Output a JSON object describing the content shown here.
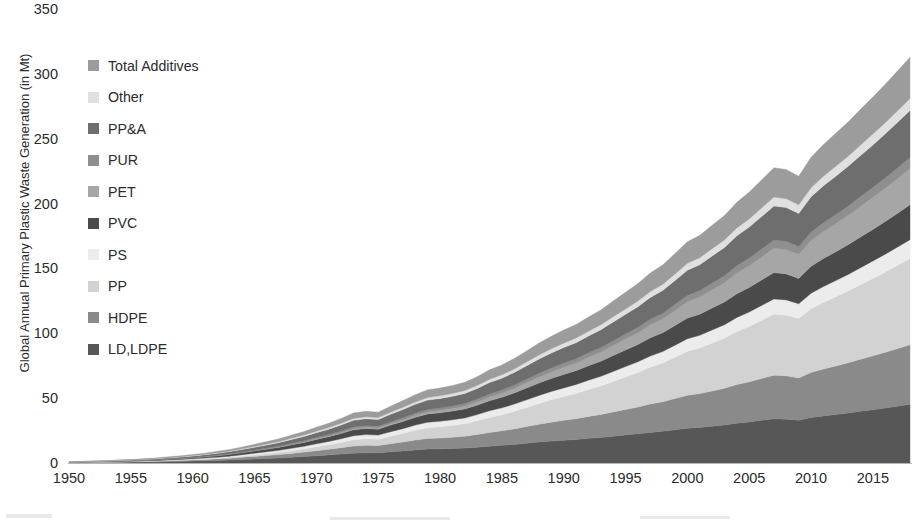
{
  "chart_data": {
    "type": "area",
    "stacked": true,
    "title": "",
    "xlabel": "",
    "ylabel": "Global Annual Primary Plastic Waste Generation (in Mt)",
    "xlim": [
      1950,
      2018
    ],
    "ylim": [
      0,
      350
    ],
    "yticks": [
      0,
      50,
      100,
      150,
      200,
      250,
      300,
      350
    ],
    "xticks": [
      1950,
      1955,
      1960,
      1965,
      1970,
      1975,
      1980,
      1985,
      1990,
      1995,
      2000,
      2005,
      2010,
      2015
    ],
    "grid": false,
    "legend_position": "upper-left-inside",
    "x": [
      1950,
      1951,
      1952,
      1953,
      1954,
      1955,
      1956,
      1957,
      1958,
      1959,
      1960,
      1961,
      1962,
      1963,
      1964,
      1965,
      1966,
      1967,
      1968,
      1969,
      1970,
      1971,
      1972,
      1973,
      1974,
      1975,
      1976,
      1977,
      1978,
      1979,
      1980,
      1981,
      1982,
      1983,
      1984,
      1985,
      1986,
      1987,
      1988,
      1989,
      1990,
      1991,
      1992,
      1993,
      1994,
      1995,
      1996,
      1997,
      1998,
      1999,
      2000,
      2001,
      2002,
      2003,
      2004,
      2005,
      2006,
      2007,
      2008,
      2009,
      2010,
      2011,
      2012,
      2013,
      2014,
      2015,
      2016,
      2017,
      2018
    ],
    "series": [
      {
        "name": "LD,LDPE",
        "color": "#575757",
        "values": [
          0.3,
          0.4,
          0.4,
          0.5,
          0.6,
          0.7,
          0.8,
          0.9,
          1.1,
          1.3,
          1.5,
          1.7,
          2.0,
          2.3,
          2.7,
          3.1,
          3.5,
          3.9,
          4.4,
          5.0,
          5.6,
          6.2,
          6.9,
          7.6,
          7.9,
          7.8,
          8.6,
          9.3,
          10.1,
          10.7,
          10.9,
          11.2,
          11.5,
          12.2,
          13.0,
          13.6,
          14.3,
          15.2,
          16.1,
          16.9,
          17.6,
          18.2,
          19.0,
          19.7,
          20.7,
          21.6,
          22.5,
          23.6,
          24.4,
          25.6,
          26.8,
          27.4,
          28.4,
          29.3,
          30.7,
          31.7,
          32.9,
          34.1,
          33.8,
          33.0,
          35.0,
          36.3,
          37.4,
          38.6,
          39.9,
          41.1,
          42.4,
          43.8,
          45.2
        ]
      },
      {
        "name": "HDPE",
        "color": "#8a8a8a",
        "values": [
          0.1,
          0.1,
          0.2,
          0.2,
          0.3,
          0.3,
          0.4,
          0.5,
          0.6,
          0.7,
          0.8,
          1.0,
          1.2,
          1.4,
          1.7,
          2.0,
          2.3,
          2.6,
          3.0,
          3.4,
          3.9,
          4.4,
          4.9,
          5.5,
          5.7,
          5.6,
          6.3,
          6.9,
          7.6,
          8.2,
          8.4,
          8.7,
          9.1,
          9.8,
          10.6,
          11.2,
          12.0,
          12.9,
          13.8,
          14.6,
          15.3,
          16.0,
          16.9,
          17.7,
          18.7,
          19.7,
          20.7,
          21.9,
          22.8,
          24.1,
          25.4,
          26.1,
          27.2,
          28.3,
          29.8,
          30.9,
          32.3,
          33.6,
          33.4,
          32.6,
          34.8,
          36.2,
          37.4,
          38.7,
          40.1,
          41.5,
          42.9,
          44.4,
          45.9
        ]
      },
      {
        "name": "PP",
        "color": "#d2d2d2",
        "values": [
          0.0,
          0.0,
          0.0,
          0.0,
          0.0,
          0.1,
          0.1,
          0.1,
          0.2,
          0.2,
          0.3,
          0.4,
          0.5,
          0.7,
          0.9,
          1.1,
          1.4,
          1.7,
          2.1,
          2.5,
          3.0,
          3.5,
          4.1,
          4.8,
          5.1,
          5.0,
          5.8,
          6.6,
          7.5,
          8.3,
          8.6,
          9.0,
          9.6,
          10.5,
          11.5,
          12.4,
          13.5,
          14.7,
          16.0,
          17.2,
          18.3,
          19.4,
          20.7,
          22.0,
          23.5,
          25.0,
          26.5,
          28.3,
          29.8,
          31.8,
          33.9,
          35.1,
          36.9,
          38.6,
          40.9,
          42.7,
          44.9,
          47.0,
          46.8,
          45.8,
          49.1,
          51.3,
          53.3,
          55.3,
          57.5,
          59.7,
          61.9,
          64.2,
          66.6
        ]
      },
      {
        "name": "PS",
        "color": "#ececec",
        "values": [
          0.1,
          0.1,
          0.1,
          0.2,
          0.2,
          0.2,
          0.3,
          0.3,
          0.4,
          0.5,
          0.6,
          0.7,
          0.8,
          0.9,
          1.1,
          1.3,
          1.4,
          1.6,
          1.8,
          2.0,
          2.3,
          2.5,
          2.8,
          3.1,
          3.2,
          3.1,
          3.4,
          3.7,
          4.0,
          4.2,
          4.3,
          4.4,
          4.5,
          4.8,
          5.1,
          5.3,
          5.6,
          5.9,
          6.2,
          6.5,
          6.7,
          6.9,
          7.2,
          7.4,
          7.7,
          8.0,
          8.3,
          8.7,
          8.9,
          9.3,
          9.7,
          9.8,
          10.1,
          10.4,
          10.8,
          11.1,
          11.4,
          11.8,
          11.7,
          11.3,
          11.9,
          12.2,
          12.5,
          12.8,
          13.1,
          13.4,
          13.8,
          14.1,
          14.5
        ]
      },
      {
        "name": "PVC",
        "color": "#4a4a4a",
        "values": [
          0.2,
          0.2,
          0.3,
          0.3,
          0.4,
          0.4,
          0.5,
          0.6,
          0.7,
          0.8,
          0.9,
          1.1,
          1.2,
          1.4,
          1.6,
          1.9,
          2.1,
          2.4,
          2.7,
          3.0,
          3.4,
          3.7,
          4.1,
          4.6,
          4.7,
          4.6,
          5.1,
          5.5,
          6.0,
          6.4,
          6.5,
          6.7,
          6.9,
          7.3,
          7.8,
          8.1,
          8.6,
          9.1,
          9.6,
          10.0,
          10.4,
          10.7,
          11.2,
          11.6,
          12.2,
          12.8,
          13.3,
          14.0,
          14.5,
          15.2,
          15.9,
          16.3,
          16.9,
          17.5,
          18.3,
          18.9,
          19.6,
          20.3,
          20.1,
          19.6,
          20.8,
          21.6,
          22.2,
          22.9,
          23.7,
          24.4,
          25.2,
          26.0,
          26.9
        ]
      },
      {
        "name": "PET",
        "color": "#a6a6a6",
        "values": [
          0.0,
          0.0,
          0.0,
          0.0,
          0.0,
          0.0,
          0.0,
          0.0,
          0.0,
          0.0,
          0.0,
          0.0,
          0.1,
          0.1,
          0.1,
          0.1,
          0.2,
          0.2,
          0.3,
          0.3,
          0.4,
          0.5,
          0.6,
          0.7,
          0.8,
          0.8,
          1.0,
          1.2,
          1.4,
          1.6,
          1.7,
          1.9,
          2.1,
          2.4,
          2.8,
          3.1,
          3.5,
          4.0,
          4.5,
          5.0,
          5.5,
          5.9,
          6.5,
          7.1,
          7.8,
          8.5,
          9.2,
          10.0,
          10.7,
          11.6,
          12.6,
          13.2,
          14.0,
          14.9,
          15.9,
          16.8,
          17.8,
          18.8,
          18.8,
          18.5,
          19.9,
          20.9,
          21.8,
          22.7,
          23.7,
          24.7,
          25.7,
          26.8,
          27.9
        ]
      },
      {
        "name": "PUR",
        "color": "#8f8f8f",
        "values": [
          0.0,
          0.0,
          0.0,
          0.0,
          0.1,
          0.1,
          0.1,
          0.1,
          0.2,
          0.2,
          0.2,
          0.3,
          0.3,
          0.4,
          0.4,
          0.5,
          0.6,
          0.7,
          0.8,
          0.9,
          1.0,
          1.1,
          1.2,
          1.4,
          1.4,
          1.4,
          1.5,
          1.7,
          1.8,
          1.9,
          2.0,
          2.0,
          2.1,
          2.2,
          2.4,
          2.5,
          2.6,
          2.8,
          3.0,
          3.1,
          3.2,
          3.3,
          3.4,
          3.6,
          3.7,
          3.9,
          4.1,
          4.3,
          4.4,
          4.7,
          4.9,
          5.0,
          5.2,
          5.4,
          5.7,
          5.9,
          6.1,
          6.4,
          6.3,
          6.1,
          6.5,
          6.8,
          7.0,
          7.2,
          7.5,
          7.7,
          8.0,
          8.3,
          8.5
        ]
      },
      {
        "name": "PP&A",
        "color": "#6e6e6e",
        "values": [
          0.2,
          0.3,
          0.3,
          0.4,
          0.4,
          0.5,
          0.6,
          0.7,
          0.8,
          0.9,
          1.1,
          1.2,
          1.4,
          1.6,
          1.9,
          2.1,
          2.4,
          2.7,
          3.1,
          3.4,
          3.8,
          4.2,
          4.7,
          5.2,
          5.3,
          5.2,
          5.8,
          6.3,
          6.8,
          7.2,
          7.3,
          7.5,
          7.8,
          8.2,
          8.8,
          9.2,
          9.7,
          10.3,
          11.0,
          11.5,
          12.0,
          12.4,
          13.0,
          13.6,
          14.4,
          15.1,
          15.9,
          16.8,
          17.4,
          18.4,
          19.4,
          20.0,
          20.9,
          21.8,
          23.0,
          23.9,
          25.0,
          26.1,
          26.0,
          25.5,
          27.2,
          28.4,
          29.5,
          30.5,
          31.6,
          32.7,
          33.9,
          35.1,
          36.3
        ]
      },
      {
        "name": "Other",
        "color": "#e0e0e0",
        "values": [
          0.0,
          0.0,
          0.1,
          0.1,
          0.1,
          0.1,
          0.1,
          0.2,
          0.2,
          0.2,
          0.3,
          0.3,
          0.4,
          0.4,
          0.5,
          0.6,
          0.7,
          0.8,
          0.9,
          1.0,
          1.1,
          1.2,
          1.3,
          1.5,
          1.5,
          1.5,
          1.6,
          1.8,
          1.9,
          2.0,
          2.1,
          2.1,
          2.2,
          2.3,
          2.5,
          2.6,
          2.7,
          2.9,
          3.1,
          3.2,
          3.4,
          3.5,
          3.6,
          3.8,
          4.0,
          4.2,
          4.4,
          4.6,
          4.8,
          5.0,
          5.3,
          5.4,
          5.6,
          5.8,
          6.1,
          6.3,
          6.6,
          6.9,
          6.8,
          6.6,
          7.0,
          7.3,
          7.6,
          7.8,
          8.1,
          8.4,
          8.6,
          8.9,
          9.2
        ]
      },
      {
        "name": "Total Additives",
        "color": "#9c9c9c",
        "values": [
          0.1,
          0.2,
          0.2,
          0.2,
          0.3,
          0.3,
          0.4,
          0.5,
          0.6,
          0.7,
          0.8,
          0.9,
          1.1,
          1.2,
          1.4,
          1.7,
          1.9,
          2.1,
          2.4,
          2.7,
          3.1,
          3.4,
          3.8,
          4.2,
          4.3,
          4.2,
          4.7,
          5.1,
          5.6,
          5.9,
          6.0,
          6.2,
          6.4,
          6.8,
          7.3,
          7.6,
          8.1,
          8.6,
          9.2,
          9.7,
          10.1,
          10.5,
          11.0,
          11.5,
          12.2,
          12.8,
          13.5,
          14.3,
          14.9,
          15.8,
          16.7,
          17.2,
          18.0,
          18.8,
          19.8,
          20.7,
          21.6,
          22.6,
          22.5,
          22.0,
          23.5,
          24.5,
          25.5,
          26.4,
          27.5,
          28.5,
          29.6,
          30.7,
          31.8
        ]
      }
    ]
  },
  "axes": {
    "ylabel": "Global Annual Primary Plastic Waste Generation (in Mt)",
    "yticks": [
      "350",
      "300",
      "250",
      "200",
      "150",
      "100",
      "50",
      "0"
    ],
    "xticks": [
      "1950",
      "1955",
      "1960",
      "1965",
      "1970",
      "1975",
      "1980",
      "1985",
      "1990",
      "1995",
      "2000",
      "2005",
      "2010",
      "2015"
    ]
  },
  "legend": {
    "items": [
      {
        "label": "Total Additives",
        "color": "#9c9c9c"
      },
      {
        "label": "Other",
        "color": "#e0e0e0"
      },
      {
        "label": "PP&A",
        "color": "#6e6e6e"
      },
      {
        "label": "PUR",
        "color": "#8f8f8f"
      },
      {
        "label": "PET",
        "color": "#a6a6a6"
      },
      {
        "label": "PVC",
        "color": "#4a4a4a"
      },
      {
        "label": "PS",
        "color": "#ececec"
      },
      {
        "label": "PP",
        "color": "#d2d2d2"
      },
      {
        "label": "HDPE",
        "color": "#8a8a8a"
      },
      {
        "label": "LD,LDPE",
        "color": "#575757"
      }
    ]
  }
}
